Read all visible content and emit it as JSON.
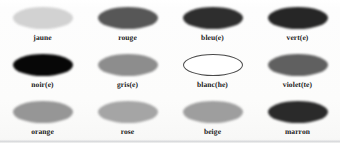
{
  "document": {
    "kind": "color-vocabulary-worksheet",
    "language": "fr",
    "background_color": "#fdfdfc",
    "label_color": "#1a1a1a"
  },
  "swatches": [
    {
      "label": "jaune",
      "name": "swatch-jaune",
      "row": 1,
      "column": 1,
      "fill": "#d2d2d2",
      "style": "filled"
    },
    {
      "label": "rouge",
      "name": "swatch-rouge",
      "row": 1,
      "column": 2,
      "fill": "#575757",
      "style": "filled"
    },
    {
      "label": "bleu(e)",
      "name": "swatch-bleu",
      "row": 1,
      "column": 3,
      "fill": "#2e2e2e",
      "style": "filled"
    },
    {
      "label": "vert(e)",
      "name": "swatch-vert",
      "row": 1,
      "column": 4,
      "fill": "#262626",
      "style": "filled"
    },
    {
      "label": "noir(e)",
      "name": "swatch-noir",
      "row": 2,
      "column": 1,
      "fill": "#070707",
      "style": "filled"
    },
    {
      "label": "gris(e)",
      "name": "swatch-gris",
      "row": 2,
      "column": 2,
      "fill": "#8d8d8d",
      "style": "filled"
    },
    {
      "label": "blanc(he)",
      "name": "swatch-blanc",
      "row": 2,
      "column": 3,
      "fill": "#ffffff",
      "style": "outline"
    },
    {
      "label": "violet(te)",
      "name": "swatch-violet",
      "row": 2,
      "column": 4,
      "fill": "#606060",
      "style": "filled"
    },
    {
      "label": "orange",
      "name": "swatch-orange",
      "row": 3,
      "column": 1,
      "fill": "#969696",
      "style": "filled"
    },
    {
      "label": "rose",
      "name": "swatch-rose",
      "row": 3,
      "column": 2,
      "fill": "#a5a5a5",
      "style": "filled"
    },
    {
      "label": "beige",
      "name": "swatch-beige",
      "row": 3,
      "column": 3,
      "fill": "#9e9e9e",
      "style": "filled"
    },
    {
      "label": "marron",
      "name": "swatch-marron",
      "row": 3,
      "column": 4,
      "fill": "#2a2a2a",
      "style": "filled"
    }
  ]
}
